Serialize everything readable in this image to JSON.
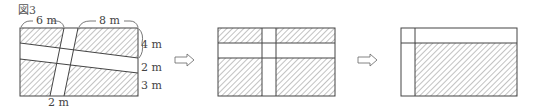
{
  "figure_title": "図3",
  "figure1": {
    "label_top_left": "6 m",
    "label_top_right": "8 m",
    "label_right_top": "4 m",
    "label_right_mid": "2 m",
    "label_right_bottom": "3 m",
    "label_bottom": "2 m"
  },
  "arrows": [
    "⇨",
    "⇨"
  ],
  "colors": {
    "line": "#444444",
    "hatch": "#666666",
    "background": "#ffffff"
  }
}
